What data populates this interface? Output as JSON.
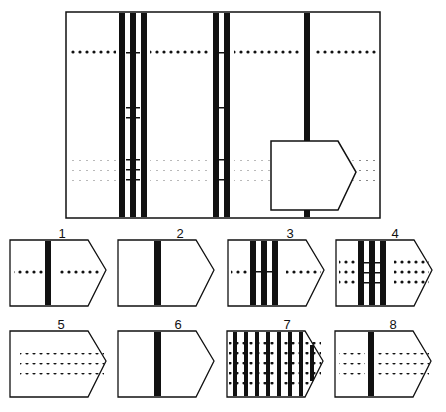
{
  "puzzle": {
    "type": "pattern-completion matrix",
    "matrix": {
      "vertical_bar_groups": [
        {
          "position": "left",
          "count": 3
        },
        {
          "position": "middle",
          "count": 2
        },
        {
          "position": "right",
          "count": 1
        }
      ],
      "dot_row_groups": [
        {
          "position": "top",
          "rows": 1
        },
        {
          "position": "middle",
          "rows": 2
        },
        {
          "position": "bottom",
          "rows": 3
        }
      ],
      "missing_piece": "pentagon cut-out at bottom-right"
    },
    "options": [
      {
        "label": "1",
        "bars": 1,
        "dot_rows": 1
      },
      {
        "label": "2",
        "bars": 1,
        "dot_rows": 0
      },
      {
        "label": "3",
        "bars": 3,
        "dot_rows": 1
      },
      {
        "label": "4",
        "bars": 3,
        "dot_rows": 3
      },
      {
        "label": "5",
        "bars": 0,
        "dot_rows": 3
      },
      {
        "label": "6",
        "bars": 1,
        "dot_rows": 2
      },
      {
        "label": "7",
        "bars": 8,
        "dot_rows": 5
      },
      {
        "label": "8",
        "bars": 1,
        "dot_rows": 3
      }
    ]
  },
  "colors": {
    "ink": "#111111",
    "paper": "#ffffff"
  }
}
